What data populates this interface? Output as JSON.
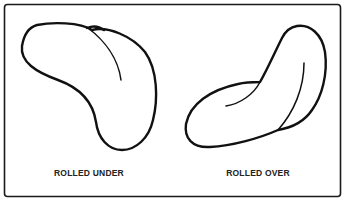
{
  "figure": {
    "panels": [
      {
        "id": "rolled-under",
        "caption": "ROLLED UNDER"
      },
      {
        "id": "rolled-over",
        "caption": "ROLLED OVER"
      }
    ],
    "colors": {
      "line": "#111111",
      "background": "#ffffff",
      "caption": "#222222"
    }
  }
}
